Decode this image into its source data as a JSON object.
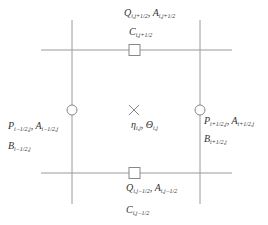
{
  "diagram": {
    "type": "staggered-grid-cell",
    "colors": {
      "line": "#999999",
      "marker": "#888888",
      "text": "#333333"
    },
    "labels": {
      "top_flux": {
        "main": "Q",
        "sub1": "i,j+1/2",
        "sep": ", ",
        "main2": "A",
        "sub2": "i,j+1/2"
      },
      "top_c": {
        "main": "C",
        "sub": "i,j+1/2"
      },
      "left_flux": {
        "main": "P",
        "sub1": "i−1/2,j",
        "sep": ", ",
        "main2": "A",
        "sub2": "i−1/2,j"
      },
      "left_b": {
        "main": "B",
        "sub": "i−1/2,j"
      },
      "right_flux": {
        "main": "P",
        "sub1": "i+1/2,j",
        "sep": ", ",
        "main2": "A",
        "sub2": "i+1/2,j"
      },
      "right_b": {
        "main": "B",
        "sub": "i+1/2,j"
      },
      "center": {
        "main": "η",
        "sub1": "i,j",
        "sep": ", ",
        "main2": "Θ",
        "sub2": "i,j"
      },
      "bottom_flux": {
        "main": "Q",
        "sub1": "i,j−1/2",
        "sep": ", ",
        "main2": "A",
        "sub2": "i,j−1/2"
      },
      "bottom_c": {
        "main": "C",
        "sub": "i,j−1/2"
      }
    },
    "markers": {
      "center": "cross-icon",
      "vertical_faces": "circle-icon",
      "horizontal_faces": "square-icon"
    }
  }
}
